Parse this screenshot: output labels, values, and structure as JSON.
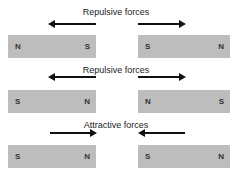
{
  "rows": [
    {
      "label": "Repulsive forces",
      "left_magnet": {
        "left": "N",
        "right": "S"
      },
      "right_magnet": {
        "left": "S",
        "right": "N"
      },
      "arrows": "outward"
    },
    {
      "label": "Repulsive forces",
      "left_magnet": {
        "left": "S",
        "right": "N"
      },
      "right_magnet": {
        "left": "N",
        "right": "S"
      },
      "arrows": "outward"
    },
    {
      "label": "Attractive forces",
      "left_magnet": {
        "left": "S",
        "right": "N"
      },
      "right_magnet": {
        "left": "S",
        "right": "N"
      },
      "arrows": "inward"
    }
  ],
  "colors": {
    "magnet": "#bdbdbd",
    "arrow": "#111111"
  }
}
